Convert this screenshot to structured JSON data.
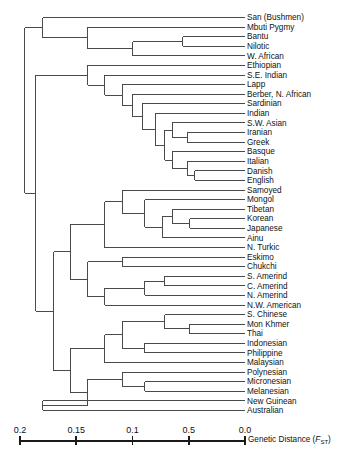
{
  "figure": {
    "type": "dendrogram",
    "orientation": "right-to-left"
  },
  "axis": {
    "title_prefix": "Genetic Distance  (",
    "title_symbol": "F",
    "title_subscript": "ST",
    "title_suffix": ")",
    "ticks": [
      {
        "label": "0.2",
        "value": 0.2
      },
      {
        "label": "0.15",
        "value": 0.15
      },
      {
        "label": "0.1",
        "value": 0.1
      },
      {
        "label": "0.5",
        "value": 0.05
      },
      {
        "label": "0.0",
        "value": 0.0
      }
    ],
    "range": [
      0.2,
      0.0
    ],
    "pixel_left": 20,
    "pixel_right": 245,
    "pixel_y": 441
  },
  "colors": {
    "branch": "#4a4a4a",
    "text": "#111111",
    "axis": "#1a1a1a",
    "background": "#ffffff"
  },
  "chart_data": {
    "type": "table",
    "xlabel": "Genetic Distance (FST)",
    "ylabel": "",
    "xlim": [
      0.2,
      0.0
    ],
    "grid": false,
    "legend": "none",
    "leaves": [
      {
        "label": "San (Bushmen)",
        "y": 12,
        "x": 0.1245
      },
      {
        "label": "Mbuti Pygmy",
        "y": 24,
        "x": 0.1245
      },
      {
        "label": "Bantu",
        "y": 36,
        "x": 0.031
      },
      {
        "label": "Nilotic",
        "y": 48,
        "x": 0.031
      },
      {
        "label": "W. African",
        "y": 60,
        "x": 0.0555
      },
      {
        "label": "Ethiopian",
        "y": 72,
        "x": 0.1245
      },
      {
        "label": "S.E. Indian",
        "y": 84,
        "x": 0.1245
      },
      {
        "label": "Lapp",
        "y": 96,
        "x": 0.0912
      },
      {
        "label": "Berber, N. African",
        "y": 108,
        "x": 0.08
      },
      {
        "label": "Sardinian",
        "y": 120,
        "x": 0.0712
      },
      {
        "label": "Indian",
        "y": 132,
        "x": 0.0645
      },
      {
        "label": "S.W. Asian",
        "y": 144,
        "x": 0.0512
      },
      {
        "label": "Iranian",
        "y": 156,
        "x": 0.04
      },
      {
        "label": "Greek",
        "y": 168,
        "x": 0.04
      },
      {
        "label": "Basque",
        "y": 180,
        "x": 0.0512
      },
      {
        "label": "Italian",
        "y": 192,
        "x": 0.0445
      },
      {
        "label": "Danish",
        "y": 204,
        "x": 0.031
      },
      {
        "label": "English",
        "y": 216,
        "x": 0.031
      },
      {
        "label": "Samoyed",
        "y": 228,
        "x": 0.0734
      },
      {
        "label": "Mongol",
        "y": 240,
        "x": 0.0734
      },
      {
        "label": "Tibetan",
        "y": 252,
        "x": 0.0578
      },
      {
        "label": "Korean",
        "y": 264,
        "x": 0.0334
      },
      {
        "label": "Japanese",
        "y": 276,
        "x": 0.0334
      },
      {
        "label": "Ainu",
        "y": 288,
        "x": 0.0645
      },
      {
        "label": "N. Turkic",
        "y": 300,
        "x": 0.109
      },
      {
        "label": "Eskimo",
        "y": 312,
        "x": 0.0712
      },
      {
        "label": "Chukchi",
        "y": 324,
        "x": 0.0712
      },
      {
        "label": "S. Amerind",
        "y": 336,
        "x": 0.049
      },
      {
        "label": "C. Amerind",
        "y": 348,
        "x": 0.049
      },
      {
        "label": "N. Amerind",
        "y": 360,
        "x": 0.0712
      },
      {
        "label": "N.W. American",
        "y": 372,
        "x": 0.109
      },
      {
        "label": "S. Chinese",
        "y": 384,
        "x": 0.049
      },
      {
        "label": "Mon Khmer",
        "y": 396,
        "x": 0.0356
      },
      {
        "label": "Thai",
        "y": 408,
        "x": 0.0356
      },
      {
        "label": "Indonesian",
        "y": 420,
        "x": 0.0712
      },
      {
        "label": "Philippine",
        "y": 432,
        "x": 0.0712
      },
      {
        "label": "Malaysian",
        "y": 444,
        "x": 0.089
      },
      {
        "label": "Polynesian",
        "y": 456,
        "x": 0.109
      },
      {
        "label": "Micronesian",
        "y": 468,
        "x": 0.0734
      },
      {
        "label": "Melanesian",
        "y": 480,
        "x": 0.0734
      },
      {
        "label": "New Guinean",
        "y": 492,
        "x": 0.149
      },
      {
        "label": "Australian",
        "y": 504,
        "x": 0.149
      }
    ],
    "nodes": [
      {
        "id": "n_bantu_nilotic",
        "x": 0.0555,
        "children_y": [
          36,
          48
        ]
      },
      {
        "id": "n_wafr",
        "x": 0.1,
        "children_y": [
          42,
          60
        ]
      },
      {
        "id": "n_mbuti_clade",
        "x": 0.14,
        "children_y": [
          24,
          51
        ]
      },
      {
        "id": "n_african",
        "x": 0.18,
        "children_y": [
          12,
          37.5
        ]
      },
      {
        "id": "n_iran_greek",
        "x": 0.0512,
        "children_y": [
          156,
          168
        ]
      },
      {
        "id": "n_swasian",
        "x": 0.0645,
        "children_y": [
          144,
          162
        ]
      },
      {
        "id": "n_dan_eng",
        "x": 0.0445,
        "children_y": [
          204,
          216
        ]
      },
      {
        "id": "n_italian",
        "x": 0.0512,
        "children_y": [
          192,
          210
        ]
      },
      {
        "id": "n_basque",
        "x": 0.0645,
        "children_y": [
          180,
          201
        ]
      },
      {
        "id": "n_eur_core",
        "x": 0.0712,
        "children_y": [
          153,
          190.5
        ]
      },
      {
        "id": "n_indian",
        "x": 0.08,
        "children_y": [
          132,
          171.75
        ]
      },
      {
        "id": "n_sardinian",
        "x": 0.0912,
        "children_y": [
          120,
          151.875
        ]
      },
      {
        "id": "n_berber",
        "x": 0.1,
        "children_y": [
          108,
          135.94
        ]
      },
      {
        "id": "n_lapp",
        "x": 0.109,
        "children_y": [
          96,
          121.97
        ]
      },
      {
        "id": "n_caucasoid",
        "x": 0.14,
        "children_y": [
          84,
          108.98
        ]
      },
      {
        "id": "n_kor_jap",
        "x": 0.049,
        "children_y": [
          264,
          276
        ]
      },
      {
        "id": "n_tibetan",
        "x": 0.0645,
        "children_y": [
          252,
          270
        ]
      },
      {
        "id": "n_ainu",
        "x": 0.0734,
        "children_y": [
          288,
          261
        ]
      },
      {
        "id": "n_mongol",
        "x": 0.089,
        "children_y": [
          240,
          274.5
        ]
      },
      {
        "id": "n_samoyed",
        "x": 0.109,
        "children_y": [
          228,
          257.25
        ]
      },
      {
        "id": "n_nturkic",
        "x": 0.1245,
        "children_y": [
          300,
          242.6
        ]
      },
      {
        "id": "n_esk_chuk",
        "x": 0.109,
        "children_y": [
          312,
          324
        ]
      },
      {
        "id": "n_sc_amerind",
        "x": 0.0712,
        "children_y": [
          336,
          348
        ]
      },
      {
        "id": "n_amerind",
        "x": 0.089,
        "children_y": [
          342,
          360
        ]
      },
      {
        "id": "n_nwamer",
        "x": 0.1245,
        "children_y": [
          351,
          372
        ]
      },
      {
        "id": "n_arctic_amer",
        "x": 0.14,
        "children_y": [
          318,
          361.5
        ]
      },
      {
        "id": "n_neasia",
        "x": 0.1555,
        "children_y": [
          271.3,
          339.75
        ]
      },
      {
        "id": "n_mon_thai",
        "x": 0.049,
        "children_y": [
          396,
          408
        ]
      },
      {
        "id": "n_schinese",
        "x": 0.0712,
        "children_y": [
          384,
          402
        ]
      },
      {
        "id": "n_ind_phil",
        "x": 0.089,
        "children_y": [
          420,
          432
        ]
      },
      {
        "id": "n_sea",
        "x": 0.109,
        "children_y": [
          393,
          426
        ]
      },
      {
        "id": "n_malay",
        "x": 0.1245,
        "children_y": [
          409.5,
          444
        ]
      },
      {
        "id": "n_micro_mela",
        "x": 0.089,
        "children_y": [
          468,
          480
        ]
      },
      {
        "id": "n_polyn",
        "x": 0.109,
        "children_y": [
          456,
          474
        ]
      },
      {
        "id": "n_oceanic",
        "x": 0.14,
        "children_y": [
          426.75,
          465
        ]
      },
      {
        "id": "n_sea_ocean",
        "x": 0.1555,
        "children_y": [
          445.875,
          445.875
        ]
      },
      {
        "id": "n_asia_all",
        "x": 0.17,
        "children_y": [
          305.5,
          445.875
        ]
      },
      {
        "id": "n_aus_png",
        "x": 0.18,
        "children_y": [
          492,
          504
        ]
      },
      {
        "id": "n_non_african",
        "x": 0.186,
        "children_y": [
          96.5,
          375.7
        ]
      },
      {
        "id": "n_root",
        "x": 0.196,
        "children_y": [
          24.75,
          236.1
        ]
      }
    ]
  }
}
